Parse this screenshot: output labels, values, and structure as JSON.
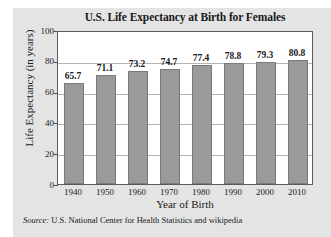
{
  "figure": {
    "source_prefix": "Source:",
    "source_text": "U.S. National Center for Health Statistics and wikipedia"
  },
  "chart_data": {
    "type": "bar",
    "title": "U.S. Life Expectancy at Birth for Females",
    "xlabel": "Year of Birth",
    "ylabel": "Life Expectancy (in years)",
    "categories": [
      "1940",
      "1950",
      "1960",
      "1970",
      "1980",
      "1990",
      "2000",
      "2010"
    ],
    "values": [
      65.7,
      71.1,
      73.2,
      74.7,
      77.4,
      78.8,
      79.3,
      80.8
    ],
    "data_labels": [
      "65.7",
      "71.1",
      "73.2",
      "74.7",
      "77.4",
      "78.8",
      "79.3",
      "80.8"
    ],
    "ylim": [
      0,
      100
    ],
    "yticks": [
      0,
      20,
      40,
      60,
      80,
      100
    ],
    "ytick_labels": [
      "0",
      "20",
      "40",
      "60",
      "80",
      "100"
    ],
    "grid": true,
    "grid_axis": "y",
    "legend": false,
    "bar_color": "#9a9a9a",
    "bar_edge_color": "#7a7a7a",
    "plot_background": "#ffffff",
    "panel_background": "#e4e4e4"
  }
}
